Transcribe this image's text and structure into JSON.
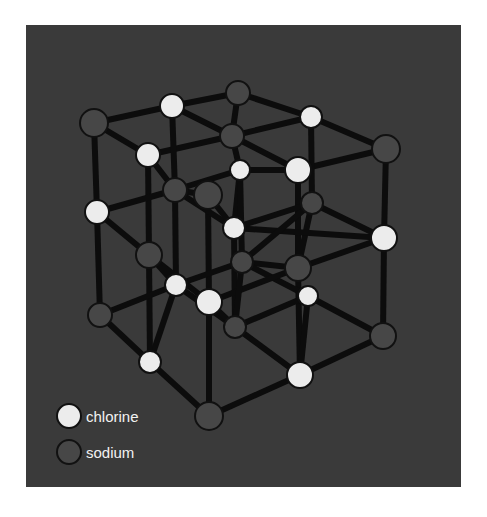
{
  "figure": {
    "colors": {
      "background": "#3a3a3a",
      "chlorine": "#ececec",
      "sodium": "#474747",
      "bond": "#0c0c0c"
    }
  },
  "legend": {
    "items": [
      {
        "label": "chlorine",
        "type": "cl"
      },
      {
        "label": "sodium",
        "type": "na"
      }
    ]
  },
  "atoms": [
    {
      "id": "A1",
      "x": 94,
      "y": 123,
      "type": "na",
      "r": 14
    },
    {
      "id": "A2",
      "x": 172,
      "y": 106,
      "type": "cl",
      "r": 12
    },
    {
      "id": "A3",
      "x": 238,
      "y": 93,
      "type": "na",
      "r": 12
    },
    {
      "id": "A4",
      "x": 148,
      "y": 155,
      "type": "cl",
      "r": 12
    },
    {
      "id": "A5",
      "x": 232,
      "y": 136,
      "type": "na",
      "r": 12
    },
    {
      "id": "A27",
      "x": 311,
      "y": 117,
      "type": "cl",
      "r": 11
    },
    {
      "id": "A7",
      "x": 208,
      "y": 195,
      "type": "na",
      "r": 14
    },
    {
      "id": "A8",
      "x": 386,
      "y": 149,
      "type": "na",
      "r": 14
    },
    {
      "id": "A9",
      "x": 240,
      "y": 170,
      "type": "cl",
      "r": 10
    },
    {
      "id": "A10",
      "x": 175,
      "y": 190,
      "type": "na",
      "r": 12
    },
    {
      "id": "A6",
      "x": 298,
      "y": 170,
      "type": "cl",
      "r": 13
    },
    {
      "id": "A11",
      "x": 312,
      "y": 203,
      "type": "na",
      "r": 11
    },
    {
      "id": "A12",
      "x": 97,
      "y": 212,
      "type": "cl",
      "r": 12
    },
    {
      "id": "A13",
      "x": 234,
      "y": 228,
      "type": "cl",
      "r": 11
    },
    {
      "id": "A14",
      "x": 384,
      "y": 238,
      "type": "cl",
      "r": 13
    },
    {
      "id": "A15",
      "x": 149,
      "y": 255,
      "type": "na",
      "r": 13
    },
    {
      "id": "A16",
      "x": 242,
      "y": 262,
      "type": "na",
      "r": 11
    },
    {
      "id": "A17",
      "x": 298,
      "y": 268,
      "type": "na",
      "r": 13
    },
    {
      "id": "A18",
      "x": 176,
      "y": 285,
      "type": "cl",
      "r": 11
    },
    {
      "id": "A19",
      "x": 209,
      "y": 302,
      "type": "cl",
      "r": 13
    },
    {
      "id": "A20",
      "x": 308,
      "y": 296,
      "type": "cl",
      "r": 10
    },
    {
      "id": "A21",
      "x": 100,
      "y": 315,
      "type": "na",
      "r": 12
    },
    {
      "id": "A22",
      "x": 235,
      "y": 327,
      "type": "na",
      "r": 11
    },
    {
      "id": "A23",
      "x": 383,
      "y": 336,
      "type": "na",
      "r": 13
    },
    {
      "id": "A24",
      "x": 150,
      "y": 362,
      "type": "cl",
      "r": 11
    },
    {
      "id": "A25",
      "x": 300,
      "y": 375,
      "type": "cl",
      "r": 13
    },
    {
      "id": "A26",
      "x": 209,
      "y": 416,
      "type": "na",
      "r": 14
    }
  ],
  "bonds": [
    [
      "A1",
      "A2"
    ],
    [
      "A2",
      "A3"
    ],
    [
      "A3",
      "A27"
    ],
    [
      "A27",
      "A8"
    ],
    [
      "A1",
      "A4"
    ],
    [
      "A2",
      "A5"
    ],
    [
      "A4",
      "A5"
    ],
    [
      "A5",
      "A27"
    ],
    [
      "A3",
      "A5"
    ],
    [
      "A4",
      "A10"
    ],
    [
      "A5",
      "A6"
    ],
    [
      "A6",
      "A8"
    ],
    [
      "A9",
      "A6"
    ],
    [
      "A10",
      "A9"
    ],
    [
      "A5",
      "A9"
    ],
    [
      "A2",
      "A10"
    ],
    [
      "A1",
      "A12"
    ],
    [
      "A12",
      "A21"
    ],
    [
      "A8",
      "A14"
    ],
    [
      "A14",
      "A23"
    ],
    [
      "A27",
      "A11"
    ],
    [
      "A11",
      "A17"
    ],
    [
      "A17",
      "A25"
    ],
    [
      "A6",
      "A17"
    ],
    [
      "A9",
      "A13"
    ],
    [
      "A13",
      "A22"
    ],
    [
      "A10",
      "A18"
    ],
    [
      "A18",
      "A24"
    ],
    [
      "A4",
      "A15"
    ],
    [
      "A15",
      "A24"
    ],
    [
      "A7",
      "A19"
    ],
    [
      "A19",
      "A26"
    ],
    [
      "A12",
      "A15"
    ],
    [
      "A15",
      "A19"
    ],
    [
      "A12",
      "A10"
    ],
    [
      "A10",
      "A13"
    ],
    [
      "A13",
      "A14"
    ],
    [
      "A15",
      "A18"
    ],
    [
      "A11",
      "A14"
    ],
    [
      "A13",
      "A11"
    ],
    [
      "A16",
      "A11"
    ],
    [
      "A18",
      "A16"
    ],
    [
      "A16",
      "A17"
    ],
    [
      "A17",
      "A14"
    ],
    [
      "A16",
      "A20"
    ],
    [
      "A21",
      "A24"
    ],
    [
      "A24",
      "A26"
    ],
    [
      "A26",
      "A25"
    ],
    [
      "A25",
      "A23"
    ],
    [
      "A21",
      "A18"
    ],
    [
      "A18",
      "A22"
    ],
    [
      "A22",
      "A20"
    ],
    [
      "A20",
      "A23"
    ],
    [
      "A19",
      "A17"
    ],
    [
      "A19",
      "A22"
    ],
    [
      "A22",
      "A25"
    ],
    [
      "A16",
      "A22"
    ],
    [
      "A20",
      "A25"
    ],
    [
      "A7",
      "A13"
    ],
    [
      "A7",
      "A10"
    ],
    [
      "A9",
      "A16"
    ]
  ]
}
